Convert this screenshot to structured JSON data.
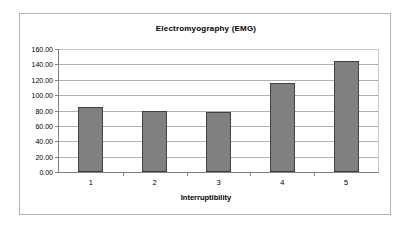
{
  "chart_data": {
    "type": "bar",
    "title": "Electromyography (EMG)",
    "xlabel": "Interruptibility",
    "ylabel": "",
    "categories": [
      "1",
      "2",
      "3",
      "4",
      "5"
    ],
    "values": [
      84,
      80,
      78,
      116,
      144
    ],
    "ylim": [
      0,
      160
    ],
    "ytick_step": 20,
    "ytick_labels": [
      "160.00",
      "140.00",
      "120.00",
      "100.00",
      "80.00",
      "60.00",
      "40.00",
      "20.00",
      "0.00"
    ],
    "ytick_values": [
      160,
      140,
      120,
      100,
      80,
      60,
      40,
      20,
      0
    ],
    "grid": true,
    "legend": false,
    "legend_position": "none",
    "series": [
      {
        "name": "EMG",
        "values": [
          84,
          80,
          78,
          116,
          144
        ]
      }
    ],
    "colors": {
      "bar_fill": "#808080",
      "bar_border": "#404040",
      "gridline": "#b0b0b0",
      "axis": "#808080",
      "plot_background": "#ffffff",
      "chart_background": "#ffffff",
      "chart_border": "#b3b3b3",
      "text": "#000000"
    }
  }
}
